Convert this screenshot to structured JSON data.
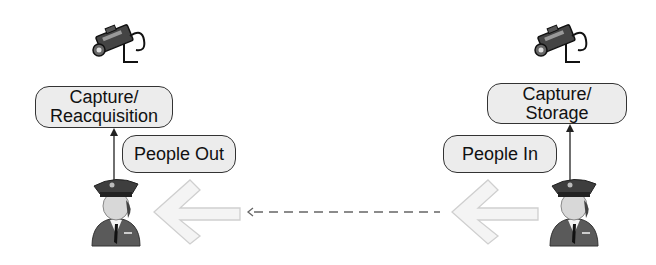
{
  "diagram": {
    "left": {
      "camera_icon": "surveillance-camera-icon",
      "process_box": {
        "line1": "Capture/",
        "line2": "Reacquisition"
      },
      "people_label": "People Out",
      "guard_icon": "security-guard-icon",
      "flow_arrow_icon": "left-arrow-icon"
    },
    "right": {
      "camera_icon": "surveillance-camera-icon",
      "process_box": {
        "line1": "Capture/",
        "line2": "Storage"
      },
      "people_label": "People In",
      "guard_icon": "security-guard-icon",
      "flow_arrow_icon": "left-arrow-icon"
    },
    "connector": {
      "style": "dashed",
      "direction": "right-to-left"
    },
    "colors": {
      "box_fill": "#ececec",
      "box_border": "#333333",
      "arrow_fill": "#f4f4f4",
      "arrow_border": "#cfcfcf",
      "guard_uniform": "#5a5a5a",
      "dashed_line": "#666666"
    }
  }
}
